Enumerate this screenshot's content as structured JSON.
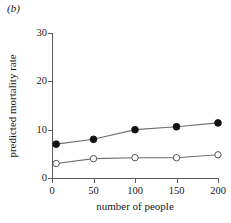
{
  "panel": {
    "label": "(b)"
  },
  "chart_data": {
    "type": "line",
    "title": "",
    "subtitle": "",
    "panel_label": "(b)",
    "xlabel": "number of people",
    "ylabel": "predicted mortality rate",
    "xlim": [
      0,
      200
    ],
    "ylim": [
      0,
      30
    ],
    "xticks": [
      0,
      50,
      100,
      150,
      200
    ],
    "yticks": [
      0,
      10,
      20,
      30
    ],
    "xtick_labels": [
      "0",
      "50",
      "100",
      "150",
      "200"
    ],
    "ytick_labels": [
      "0",
      "10",
      "20",
      "30"
    ],
    "grid": false,
    "legend": "none",
    "x": [
      5,
      50,
      100,
      150,
      200
    ],
    "series": [
      {
        "name": "filled-circles",
        "marker": "filled-circle",
        "color": "#111111",
        "values": [
          7.0,
          8.0,
          10.0,
          10.6,
          11.4
        ]
      },
      {
        "name": "open-circles",
        "marker": "open-circle",
        "color": "#555555",
        "values": [
          3.0,
          4.0,
          4.2,
          4.2,
          4.8
        ]
      }
    ]
  },
  "colors": {
    "axis": "#5a5a5a",
    "line": "#6e6e6e",
    "filled_marker": "#111111",
    "open_marker_stroke": "#555555",
    "background": "#ffffff",
    "text": "#1a1a1a"
  }
}
